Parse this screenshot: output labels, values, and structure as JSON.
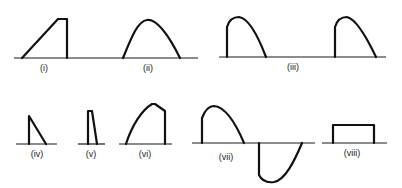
{
  "figure": {
    "panels": [
      {
        "id": "i",
        "label": "(i)",
        "description": "ramp rising then flat top, then sharp vertical drop"
      },
      {
        "id": "ii",
        "label": "(ii)",
        "description": "smooth single positive hump (half sine)"
      },
      {
        "id": "iii",
        "label": "(iii)",
        "description": "two repeated pulses with vertical rise then decaying curve"
      },
      {
        "id": "iv",
        "label": "(iv)",
        "description": "vertical rise then linear decay (right triangle)"
      },
      {
        "id": "v",
        "label": "(v)",
        "description": "narrow near-rectangular pulse with slightly slanted falling edge"
      },
      {
        "id": "vi",
        "label": "(vi)",
        "description": "curved rise to peak, short slope, then vertical drop"
      },
      {
        "id": "vii",
        "label": "(vii)",
        "description": "positive lobe with vertical start followed by negative lobe"
      },
      {
        "id": "viii",
        "label": "(viii)",
        "description": "rectangular pulse"
      }
    ]
  }
}
